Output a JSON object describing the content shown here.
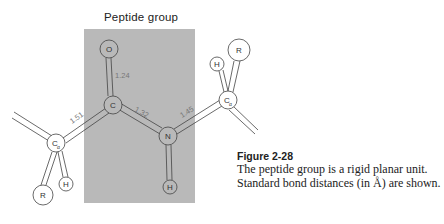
{
  "figure": {
    "region_title": "Peptide group",
    "shading_color": "#b9b9b9",
    "atoms": {
      "left_calpha": {
        "label": "C",
        "sub": "α"
      },
      "left_r": {
        "label": "R"
      },
      "left_h": {
        "label": "H"
      },
      "carbonyl_c": {
        "label": "C"
      },
      "carbonyl_o": {
        "label": "O"
      },
      "amide_n": {
        "label": "N"
      },
      "amide_h": {
        "label": "H"
      },
      "right_calpha": {
        "label": "C",
        "sub": "α"
      },
      "right_h": {
        "label": "H"
      },
      "right_r": {
        "label": "R"
      }
    },
    "bond_lengths": {
      "calpha_c": "1.51",
      "c_o": "1.24",
      "c_n": "1.32",
      "n_calpha": "1.45"
    }
  },
  "caption": {
    "title": "Figure 2-28",
    "text": "The peptide group is a rigid planar unit. Standard bond distances (in Å) are shown."
  }
}
